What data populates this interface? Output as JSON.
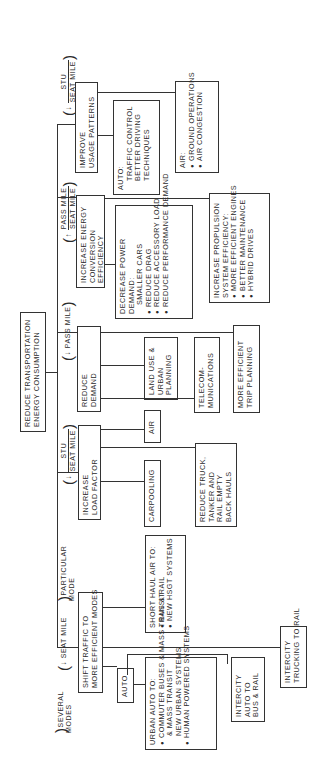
{
  "diagram": {
    "root": {
      "lines": [
        "REDUCE TRANSPORTATION",
        "ENERGY CONSUMPTION"
      ]
    },
    "metric_labels": {
      "shift": {
        "arrow": "↓",
        "numerator": "STU",
        "denominator": "SEAT MILE"
      },
      "load_factor": {
        "arrow": "↑",
        "numerator": "PASS MILE",
        "denominator": "SEAT MILE"
      },
      "reduce_demand": {
        "arrow": "↓",
        "text": "PASS MILE"
      },
      "conversion": {
        "arrow": "↓",
        "numerator": "STU",
        "denominator": "SEAT MILE"
      },
      "particular_mode": "PARTICULAR MODE",
      "usage": {
        "arrow": "↓",
        "text": "SEAT MILE"
      },
      "several_modes": "SEVERAL MODES"
    },
    "branches": {
      "shift_traffic": {
        "lines": [
          "SHIFT TRAFFIC TO",
          "MORE EFFICIENT MODES"
        ],
        "children": {
          "short_haul": {
            "lines": [
              "SHORT HAUL AIR TO:"
            ],
            "bullets": [
              "BUS & RAIL",
              "NEW HSGT SYSTEMS"
            ]
          },
          "auto": {
            "label": "AUTO"
          },
          "urban_auto": {
            "lines": [
              "URBAN AUTO TO:"
            ],
            "bullets": [
              "COMMUTER BUSES & MASS TRANSIT",
              "NEW URBAN SYSTEMS",
              "HUMAN POWERED SYSTEMS"
            ]
          },
          "intercity_auto": {
            "lines": [
              "INTERCITY",
              "AUTO TO",
              "BUS & RAIL"
            ]
          },
          "intercity_trucking": {
            "lines": [
              "INTERCITY",
              "TRUCKING TO RAIL"
            ]
          }
        }
      },
      "load_factor": {
        "lines": [
          "INCREASE",
          "LOAD FACTOR"
        ],
        "children": {
          "carpooling": {
            "label": "CARPOOLING"
          },
          "air": {
            "label": "AIR"
          },
          "reduce_truck": {
            "lines": [
              "REDUCE TRUCK,",
              "TANKER AND",
              "RAIL EMPTY",
              "BACK HAULS"
            ]
          }
        }
      },
      "reduce_demand": {
        "lines": [
          "REDUCE",
          "DEMAND"
        ],
        "children": {
          "land_use": {
            "lines": [
              "LAND USE &",
              "URBAN",
              "PLANNING"
            ]
          },
          "telecom": {
            "lines": [
              "TELECOM-",
              "MUNICATIONS"
            ]
          },
          "trip_planning": {
            "lines": [
              "MORE EFFICIENT",
              "TRIP PLANNING"
            ]
          }
        }
      },
      "conversion": {
        "lines": [
          "INCREASE ENERGY",
          "CONVERSION",
          "EFFICIENCY"
        ],
        "children": {
          "power_demand": {
            "lines": [
              "DECREASE POWER",
              "DEMAND:",
              "SMALLER CARS"
            ],
            "bullets": [
              "REDUCE DRAG",
              "REDUCE ACCESSORY LOAD",
              "REDUCE PERFORMANCE DEMAND"
            ]
          },
          "propulsion": {
            "lines": [
              "INCREASE PROPULSION",
              "SYSTEM EFFICIENCY:"
            ],
            "bullets": [
              "MORE EFFICIENT ENGINES",
              "BETTER MAINTENANCE",
              "HYBRID DRIVES"
            ]
          }
        }
      },
      "usage": {
        "lines": [
          "IMPROVE",
          "USAGE PATTERNS"
        ],
        "children": {
          "auto": {
            "lines": [
              "AUTO:",
              "TRAFFIC CONTROL",
              "BETTER DRIVING",
              "TECHNIQUES"
            ]
          },
          "air": {
            "lines": [
              "AIR:"
            ],
            "bullets": [
              "GROUND OPERATIONS",
              "AIR CONGESTION"
            ]
          }
        }
      }
    }
  }
}
